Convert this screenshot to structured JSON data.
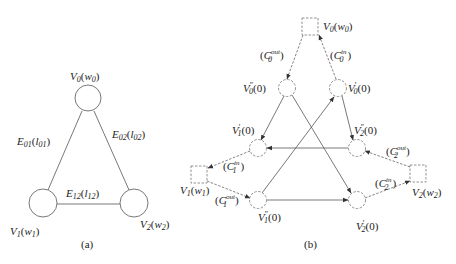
{
  "panel_a": {
    "caption": "(a)",
    "nodes": {
      "v0": {
        "name": "V",
        "sub": "0",
        "arg": "w",
        "argsub": "0"
      },
      "v1": {
        "name": "V",
        "sub": "1",
        "arg": "w",
        "argsub": "1"
      },
      "v2": {
        "name": "V",
        "sub": "2",
        "arg": "w",
        "argsub": "2"
      }
    },
    "edges": {
      "e01": {
        "name": "E",
        "sub": "01",
        "arg": "l",
        "argsub": "01"
      },
      "e02": {
        "name": "E",
        "sub": "02",
        "arg": "l",
        "argsub": "02"
      },
      "e12": {
        "name": "E",
        "sub": "12",
        "arg": "l",
        "argsub": "12"
      }
    }
  },
  "panel_b": {
    "caption": "(b)",
    "squares": {
      "v0": {
        "name": "V",
        "sub": "0",
        "arg": "w",
        "argsub": "0"
      },
      "v1": {
        "name": "V",
        "sub": "1",
        "arg": "w",
        "argsub": "1"
      },
      "v2": {
        "name": "V",
        "sub": "2",
        "arg": "w",
        "argsub": "2"
      }
    },
    "circles": {
      "v0pp": {
        "name": "V",
        "sub": "0",
        "prime": "″",
        "arg": "0"
      },
      "v0p": {
        "name": "V",
        "sub": "0",
        "prime": "′",
        "arg": "0"
      },
      "v1p": {
        "name": "V",
        "sub": "1",
        "prime": "′",
        "arg": "0"
      },
      "v2pp": {
        "name": "V",
        "sub": "2",
        "prime": "″",
        "arg": "0"
      },
      "v1pp": {
        "name": "V",
        "sub": "1",
        "prime": "″",
        "arg": "0"
      },
      "v2p": {
        "name": "V",
        "sub": "2",
        "prime": "′",
        "arg": "0"
      }
    },
    "capacities": {
      "c0out": {
        "name": "C",
        "sub": "0",
        "sup": "out"
      },
      "c0in": {
        "name": "C",
        "sub": "0",
        "sup": "in"
      },
      "c1in": {
        "name": "C",
        "sub": "1",
        "sup": "in"
      },
      "c1out": {
        "name": "C",
        "sub": "1",
        "sup": "out"
      },
      "c2out": {
        "name": "C",
        "sub": "2",
        "sup": "out"
      },
      "c2in": {
        "name": "C",
        "sub": "2",
        "sup": "in"
      }
    }
  }
}
